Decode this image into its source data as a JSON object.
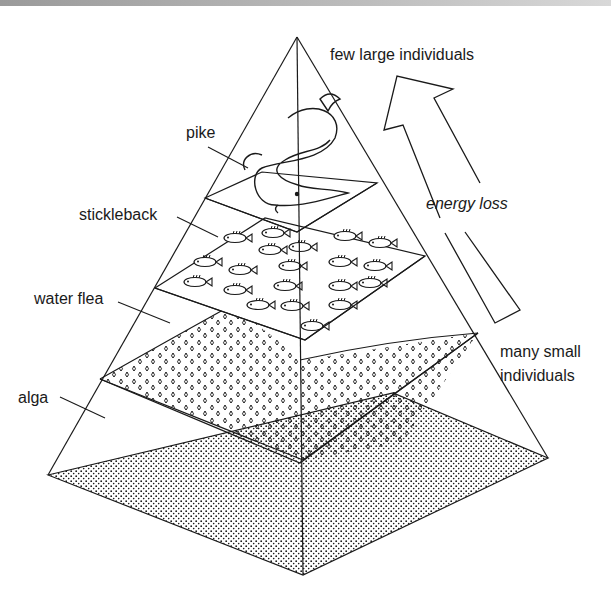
{
  "diagram": {
    "type": "ecological pyramid",
    "levels": [
      {
        "name": "pike",
        "label": "pike",
        "position": "top"
      },
      {
        "name": "stickleback",
        "label": "stickleback",
        "position": "second"
      },
      {
        "name": "water flea",
        "label": "water flea",
        "position": "third"
      },
      {
        "name": "alga",
        "label": "alga",
        "position": "base"
      }
    ],
    "annotations": {
      "top": "few large individuals",
      "bottom_line1": "many small",
      "bottom_line2": "individuals",
      "arrow": "energy loss"
    },
    "arrow_direction": "up"
  },
  "colors": {
    "ink": "#1a1a1a",
    "background": "#ffffff"
  }
}
